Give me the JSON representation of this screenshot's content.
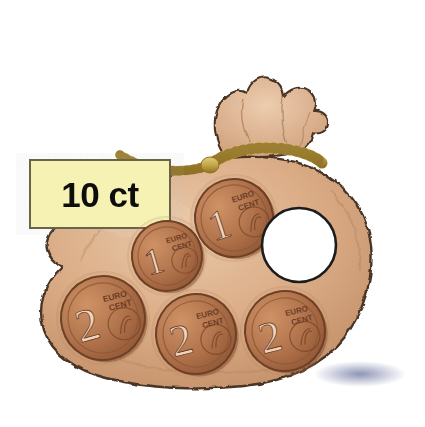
{
  "scene": {
    "title": "money-bag-with-euro-cent-coins",
    "width": 425,
    "height": 427,
    "background_color": "#ffffff"
  },
  "label": {
    "text": "10 ct",
    "value": 10,
    "unit": "ct",
    "fill_color": "#f6f2b4",
    "border_color": "#6b6347",
    "text_color": "#101010",
    "x": 30,
    "y": 160,
    "width": 140,
    "height": 68
  },
  "bag": {
    "name": "money-bag",
    "body_color": "#d9ab85",
    "body_shade_color": "#c0875e",
    "highlight_color": "#e7c3a3",
    "outline_color": "#4a3526",
    "cord_color": "#c9a84c",
    "cord_shade_color": "#9a7b2c",
    "shadow_color": "#8a8fb0"
  },
  "coins": [
    {
      "id": "coin-1c-upper",
      "denomination": "1",
      "unit_line1": "EURO",
      "unit_line2": "CENT",
      "value_cents": 1,
      "cx": 234,
      "cy": 218,
      "r": 39,
      "rotation": -18,
      "face_color": "#b4764f",
      "rim_color": "#8a5333"
    },
    {
      "id": "coin-1c-lower",
      "denomination": "1",
      "unit_line1": "EURO",
      "unit_line2": "CENT",
      "value_cents": 1,
      "cx": 167,
      "cy": 256,
      "r": 35,
      "rotation": -16,
      "face_color": "#b4764f",
      "rim_color": "#8a5333"
    },
    {
      "id": "coin-2c-left",
      "denomination": "2",
      "unit_line1": "EURO",
      "unit_line2": "CENT",
      "value_cents": 2,
      "cx": 103,
      "cy": 318,
      "r": 42,
      "rotation": -15,
      "face_color": "#b4764f",
      "rim_color": "#8a5333"
    },
    {
      "id": "coin-2c-middle",
      "denomination": "2",
      "unit_line1": "EURO",
      "unit_line2": "CENT",
      "value_cents": 2,
      "cx": 196,
      "cy": 334,
      "r": 40,
      "rotation": -14,
      "face_color": "#b4764f",
      "rim_color": "#8a5333"
    },
    {
      "id": "coin-2c-right",
      "denomination": "2",
      "unit_line1": "EURO",
      "unit_line2": "CENT",
      "value_cents": 2,
      "cx": 285,
      "cy": 331,
      "r": 40,
      "rotation": -14,
      "face_color": "#b4764f",
      "rim_color": "#8a5333"
    }
  ],
  "empty_slot": {
    "name": "empty-coin-slot",
    "cx": 299,
    "cy": 245,
    "r": 37,
    "fill_color": "#ffffff",
    "outline_color": "#1c1c1c"
  }
}
